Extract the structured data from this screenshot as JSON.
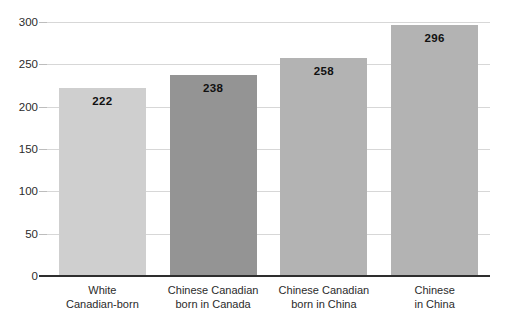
{
  "chart_data": {
    "type": "bar",
    "title": "",
    "subtitle": "",
    "xlabel": "",
    "ylabel": "",
    "categories": [
      "White\nCanadian-born",
      "Chinese Canadian\nborn in Canada",
      "Chinese Canadian\nborn in China",
      "Chinese\nin China"
    ],
    "category_lines": [
      [
        "White",
        "Canadian-born"
      ],
      [
        "Chinese Canadian",
        "born in Canada"
      ],
      [
        "Chinese Canadian",
        "born in China"
      ],
      [
        "Chinese",
        "in China"
      ]
    ],
    "values": [
      222,
      238,
      258,
      296
    ],
    "value_labels": [
      "222",
      "238",
      "258",
      "296"
    ],
    "bar_colors": [
      "#cfcfcf",
      "#949494",
      "#b3b3b3",
      "#b3b3b3"
    ],
    "ylim": [
      0,
      300
    ],
    "yticks": [
      0,
      50,
      100,
      150,
      200,
      250,
      300
    ],
    "ytick_labels": [
      "0",
      "50",
      "100",
      "150",
      "200",
      "250",
      "300"
    ],
    "grid": true,
    "grid_axis": "y",
    "grid_color": "#d7d7d7",
    "axis_color": "#2e2e2e",
    "legend": null,
    "legend_position": "none",
    "annotations": []
  },
  "colors": {
    "background": "#ffffff",
    "text": "#2b2b2b",
    "value_text": "#111111"
  }
}
